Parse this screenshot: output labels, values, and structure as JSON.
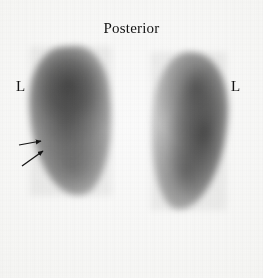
{
  "image": {
    "modality": "nuclear-medicine-renal-scintigram",
    "width": 263,
    "height": 278,
    "background_color": "#fafaf8",
    "ink_color": "#131313"
  },
  "annotations": {
    "view_title": "Posterior",
    "left_marker": "L",
    "right_marker": "L"
  },
  "markers": [
    {
      "name": "left-lateral-marker",
      "label": "L",
      "x": 16,
      "y": 79
    },
    {
      "name": "right-lateral-marker",
      "label": "L",
      "x": 231,
      "y": 79
    }
  ],
  "arrows": [
    {
      "name": "upper-arrow",
      "tail_x": 19,
      "tail_y": 145,
      "tip_x": 41,
      "tip_y": 141,
      "points_to": "left-kidney-lateral-border"
    },
    {
      "name": "lower-arrow",
      "tail_x": 22,
      "tail_y": 166,
      "tip_x": 43,
      "tip_y": 151,
      "points_to": "left-kidney-lateral-border"
    }
  ],
  "regions": [
    {
      "name": "left-kidney-uptake",
      "side": "left",
      "x": 30,
      "y": 46,
      "width": 82,
      "height": 150
    },
    {
      "name": "right-kidney-uptake",
      "side": "right",
      "x": 151,
      "y": 52,
      "width": 76,
      "height": 158
    }
  ]
}
